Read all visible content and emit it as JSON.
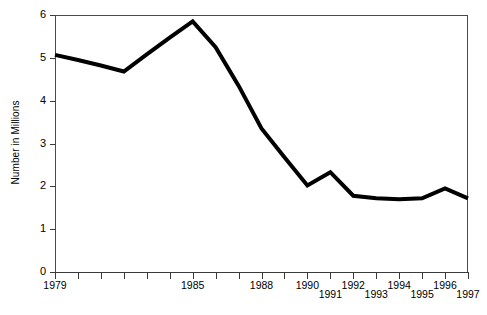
{
  "chart_data": {
    "type": "line",
    "title": "",
    "subtitle": "",
    "xlabel": "",
    "ylabel": "Number in Millions",
    "xlim": [
      1979,
      1997
    ],
    "ylim": [
      0,
      6
    ],
    "grid": false,
    "legend": false,
    "legend_position": "none",
    "y_ticks": [
      0,
      1,
      2,
      3,
      4,
      5,
      6
    ],
    "y_tick_labels": [
      "0",
      "1",
      "2",
      "3",
      "4",
      "5",
      "6"
    ],
    "x_ticks": [
      1979,
      1980,
      1981,
      1982,
      1983,
      1984,
      1985,
      1986,
      1987,
      1988,
      1989,
      1990,
      1991,
      1992,
      1993,
      1994,
      1995,
      1996,
      1997
    ],
    "x_tick_labels": [
      {
        "year": 1979,
        "label": "1979",
        "shown": true,
        "row": 0
      },
      {
        "year": 1980,
        "label": "",
        "shown": false,
        "row": 0
      },
      {
        "year": 1981,
        "label": "",
        "shown": false,
        "row": 0
      },
      {
        "year": 1982,
        "label": "",
        "shown": false,
        "row": 0
      },
      {
        "year": 1983,
        "label": "",
        "shown": false,
        "row": 0
      },
      {
        "year": 1984,
        "label": "",
        "shown": false,
        "row": 0
      },
      {
        "year": 1985,
        "label": "1985",
        "shown": true,
        "row": 0
      },
      {
        "year": 1986,
        "label": "",
        "shown": false,
        "row": 0
      },
      {
        "year": 1987,
        "label": "",
        "shown": false,
        "row": 0
      },
      {
        "year": 1988,
        "label": "1988",
        "shown": true,
        "row": 0
      },
      {
        "year": 1989,
        "label": "",
        "shown": false,
        "row": 0
      },
      {
        "year": 1990,
        "label": "1990",
        "shown": true,
        "row": 0
      },
      {
        "year": 1991,
        "label": "1991",
        "shown": true,
        "row": 1
      },
      {
        "year": 1992,
        "label": "1992",
        "shown": true,
        "row": 0
      },
      {
        "year": 1993,
        "label": "1993",
        "shown": true,
        "row": 1
      },
      {
        "year": 1994,
        "label": "1994",
        "shown": true,
        "row": 0
      },
      {
        "year": 1995,
        "label": "1995",
        "shown": true,
        "row": 1
      },
      {
        "year": 1996,
        "label": "1996",
        "shown": true,
        "row": 0
      },
      {
        "year": 1997,
        "label": "1997",
        "shown": true,
        "row": 1
      }
    ],
    "series": [
      {
        "name": "Number in Millions",
        "color": "#000000",
        "line_width": 4,
        "x": [
          1979,
          1980,
          1981,
          1982,
          1983,
          1984,
          1985,
          1986,
          1987,
          1988,
          1989,
          1990,
          1991,
          1992,
          1993,
          1994,
          1995,
          1996,
          1997
        ],
        "values": [
          5.07,
          4.95,
          4.82,
          4.68,
          5.08,
          5.47,
          5.85,
          5.25,
          4.35,
          3.35,
          2.68,
          2.02,
          2.33,
          1.78,
          1.72,
          1.7,
          1.72,
          1.95,
          1.72
        ]
      }
    ]
  },
  "axis": {
    "y_title": "Number in Millions"
  },
  "colors": {
    "line": "#000000",
    "axis": "#3a3a3a",
    "frame": "#4a4a4a",
    "background": "#ffffff"
  }
}
